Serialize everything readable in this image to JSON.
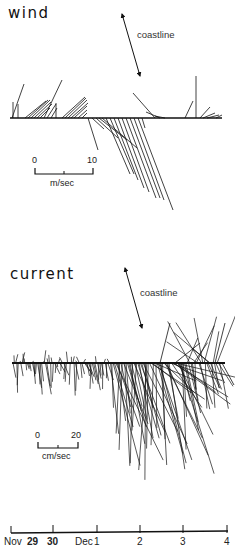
{
  "chart_data": [
    {
      "type": "stick-plot",
      "title": "wind",
      "orientation_reference": "coastline",
      "scale": {
        "min": 0,
        "max": 10,
        "unit": "m/sec",
        "length_px": 58
      },
      "baseline_y": 118,
      "x_range_px": [
        10,
        222
      ],
      "vectors": [
        {
          "x": 12,
          "dx": 12,
          "dy": -34
        },
        {
          "x": 13,
          "dx": 0,
          "dy": -16
        },
        {
          "x": 18,
          "dx": 0,
          "dy": -14
        },
        {
          "x": 25,
          "dx": 21,
          "dy": -17
        },
        {
          "x": 28,
          "dx": 20,
          "dy": -18
        },
        {
          "x": 31,
          "dx": 19,
          "dy": -18
        },
        {
          "x": 34,
          "dx": 17,
          "dy": -16
        },
        {
          "x": 37,
          "dx": 15,
          "dy": -14
        },
        {
          "x": 40,
          "dx": 10,
          "dy": -10
        },
        {
          "x": 44,
          "dx": 18,
          "dy": -38
        },
        {
          "x": 47,
          "dx": 9,
          "dy": -14
        },
        {
          "x": 51,
          "dx": 6,
          "dy": -10
        },
        {
          "x": 56,
          "dx": 0,
          "dy": -15
        },
        {
          "x": 62,
          "dx": 23,
          "dy": -21
        },
        {
          "x": 65,
          "dx": 21,
          "dy": -20
        },
        {
          "x": 68,
          "dx": 19,
          "dy": -18
        },
        {
          "x": 71,
          "dx": 17,
          "dy": -15
        },
        {
          "x": 74,
          "dx": 13,
          "dy": -12
        },
        {
          "x": 78,
          "dx": 9,
          "dy": -8
        },
        {
          "x": 82,
          "dx": 5,
          "dy": -5
        },
        {
          "x": 88,
          "dx": 10,
          "dy": 32
        },
        {
          "x": 92,
          "dx": 12,
          "dy": 11
        },
        {
          "x": 96,
          "dx": 22,
          "dy": 20
        },
        {
          "x": 99,
          "dx": 28,
          "dy": 22
        },
        {
          "x": 102,
          "dx": 35,
          "dy": 30
        },
        {
          "x": 106,
          "dx": 24,
          "dy": 56
        },
        {
          "x": 110,
          "dx": 24,
          "dy": 56
        },
        {
          "x": 114,
          "dx": 24,
          "dy": 62
        },
        {
          "x": 118,
          "dx": 26,
          "dy": 70
        },
        {
          "x": 122,
          "dx": 27,
          "dy": 74
        },
        {
          "x": 126,
          "dx": 30,
          "dy": 80
        },
        {
          "x": 130,
          "dx": 30,
          "dy": 80
        },
        {
          "x": 134,
          "dx": 30,
          "dy": 82
        },
        {
          "x": 138,
          "dx": 35,
          "dy": 92
        },
        {
          "x": 142,
          "dx": 3,
          "dy": 10
        },
        {
          "x": 155,
          "dx": -22,
          "dy": -25
        },
        {
          "x": 160,
          "dx": -14,
          "dy": -6
        },
        {
          "x": 165,
          "dx": -10,
          "dy": -2
        },
        {
          "x": 185,
          "dx": 8,
          "dy": -17
        },
        {
          "x": 196,
          "dx": 0,
          "dy": -42
        },
        {
          "x": 200,
          "dx": 10,
          "dy": -11
        },
        {
          "x": 203,
          "dx": 12,
          "dy": -5
        },
        {
          "x": 207,
          "dx": 12,
          "dy": -3
        },
        {
          "x": 216,
          "dx": 6,
          "dy": -3
        }
      ]
    },
    {
      "type": "stick-plot",
      "title": "current",
      "orientation_reference": "coastline",
      "scale": {
        "min": 0,
        "max": 20,
        "unit": "cm/sec",
        "length_px": 40
      },
      "baseline_y": 363,
      "x_range_px": [
        12,
        225
      ],
      "seed": 7
    }
  ],
  "wind_panel": {
    "title": "wind",
    "coastline_label": "coastline",
    "scale": {
      "zero_label": "0",
      "max_label": "10",
      "unit_label": "m/sec"
    }
  },
  "current_panel": {
    "title": "current",
    "coastline_label": "coastline",
    "scale": {
      "zero_label": "0",
      "max_label": "20",
      "unit_label": "cm/sec"
    }
  },
  "time_axis": {
    "ticks": [
      {
        "label": "Nov",
        "x": 10,
        "bold": false,
        "tick": false
      },
      {
        "label": "29",
        "x": 33,
        "bold": true,
        "tick": false
      },
      {
        "label": "30",
        "x": 53,
        "bold": true,
        "tick": true
      },
      {
        "label": "Dec",
        "x": 81,
        "bold": false,
        "tick": false
      },
      {
        "label": "1",
        "x": 97,
        "bold": false,
        "tick": true
      },
      {
        "label": "2",
        "x": 140,
        "bold": false,
        "tick": true
      },
      {
        "label": "3",
        "x": 183,
        "bold": false,
        "tick": true
      },
      {
        "label": "4",
        "x": 227,
        "bold": false,
        "tick": true
      }
    ],
    "axis_start_x": 11,
    "axis_end_x": 228,
    "axis_y": 533
  },
  "colors": {
    "ink": "#111111",
    "background": "#ffffff"
  }
}
